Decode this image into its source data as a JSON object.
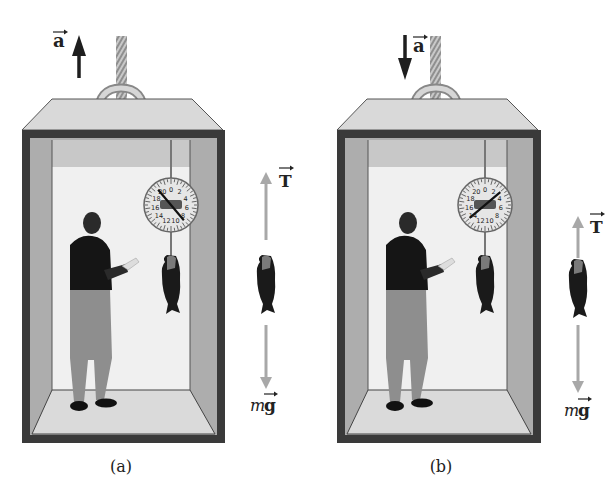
{
  "figure": {
    "panels": [
      {
        "id": "a",
        "caption": "(a)",
        "acceleration_label": "a",
        "acceleration_direction": "up",
        "tension_label": "T",
        "weight_label_m": "m",
        "weight_label_g": "g",
        "scale_numbers": [
          "20",
          "0",
          "2",
          "4",
          "6",
          "8",
          "10",
          "12",
          "14",
          "16",
          "18"
        ],
        "scale_reading_note": "needle points toward ~9 (heavier reading)"
      },
      {
        "id": "b",
        "caption": "(b)",
        "acceleration_label": "a",
        "acceleration_direction": "down",
        "tension_label": "T",
        "weight_label_m": "m",
        "weight_label_g": "g",
        "scale_numbers": [
          "20",
          "0",
          "2",
          "4",
          "6",
          "8",
          "10",
          "12",
          "14",
          "16",
          "18"
        ],
        "scale_reading_note": "needle points toward ~3 (lighter reading)"
      }
    ],
    "colors": {
      "frame": "#3a3a3a",
      "roof": "#d8d8d8",
      "inner_wall": "#a9a9a9",
      "back_wall": "#f2f2f2",
      "floor": "#dcdcdc",
      "force_arrow": "#a8a8a8",
      "accel_arrow": "#1e1e1e"
    }
  }
}
